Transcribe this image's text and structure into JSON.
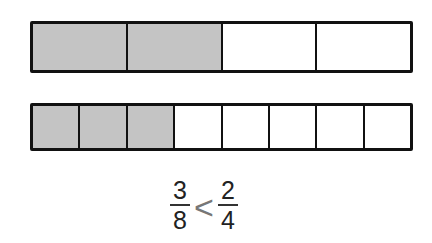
{
  "diagram": {
    "bars": [
      {
        "name": "fourths",
        "parts": 4,
        "shaded": 2
      },
      {
        "name": "eighths",
        "parts": 8,
        "shaded": 3
      }
    ],
    "comparison": {
      "left": {
        "numerator": "3",
        "denominator": "8"
      },
      "symbol": "<",
      "right": {
        "numerator": "2",
        "denominator": "4"
      }
    },
    "colors": {
      "shaded": "#c4c4c4",
      "outline": "#111111",
      "empty": "#ffffff"
    }
  }
}
